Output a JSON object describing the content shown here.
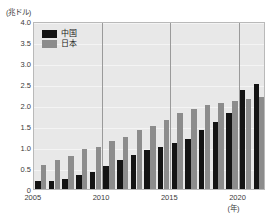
{
  "chart_data": {
    "type": "bar",
    "title": "",
    "xlabel": "(年)",
    "ylabel": "(兆ドル)",
    "ylim": [
      0,
      4.0
    ],
    "grid": true,
    "legend_position": "top-left",
    "y_ticks": [
      "0",
      "0.5",
      "1.0",
      "1.5",
      "2.0",
      "2.5",
      "3.0",
      "3.5",
      "4.0"
    ],
    "y_tick_values": [
      0,
      0.5,
      1.0,
      1.5,
      2.0,
      2.5,
      3.0,
      3.5,
      4.0
    ],
    "x_ticks": [
      "2005",
      "2010",
      "2015",
      "2020"
    ],
    "categories": [
      "2005",
      "2006",
      "2007",
      "2008",
      "2009",
      "2010",
      "2011",
      "2012",
      "2013",
      "2014",
      "2015",
      "2016",
      "2017",
      "2018",
      "2019",
      "2020",
      "2021"
    ],
    "series": [
      {
        "name": "中国",
        "color": "#141414",
        "values": [
          0.18,
          0.2,
          0.25,
          0.33,
          0.4,
          0.55,
          0.7,
          0.8,
          0.92,
          1.0,
          1.1,
          1.2,
          1.4,
          1.6,
          1.8,
          2.35,
          2.5
        ]
      },
      {
        "name": "日本",
        "color": "#8c8c8c",
        "values": [
          0.57,
          0.7,
          0.78,
          0.95,
          1.0,
          1.15,
          1.25,
          1.4,
          1.5,
          1.65,
          1.8,
          1.9,
          2.0,
          2.05,
          2.1,
          2.15,
          2.2
        ]
      }
    ]
  },
  "legend": {
    "items": [
      {
        "label": "中国",
        "color": "#141414"
      },
      {
        "label": "日本",
        "color": "#8c8c8c"
      }
    ]
  },
  "axis": {
    "y_unit_label": "(兆ドル)",
    "x_unit_label": "(年)"
  }
}
